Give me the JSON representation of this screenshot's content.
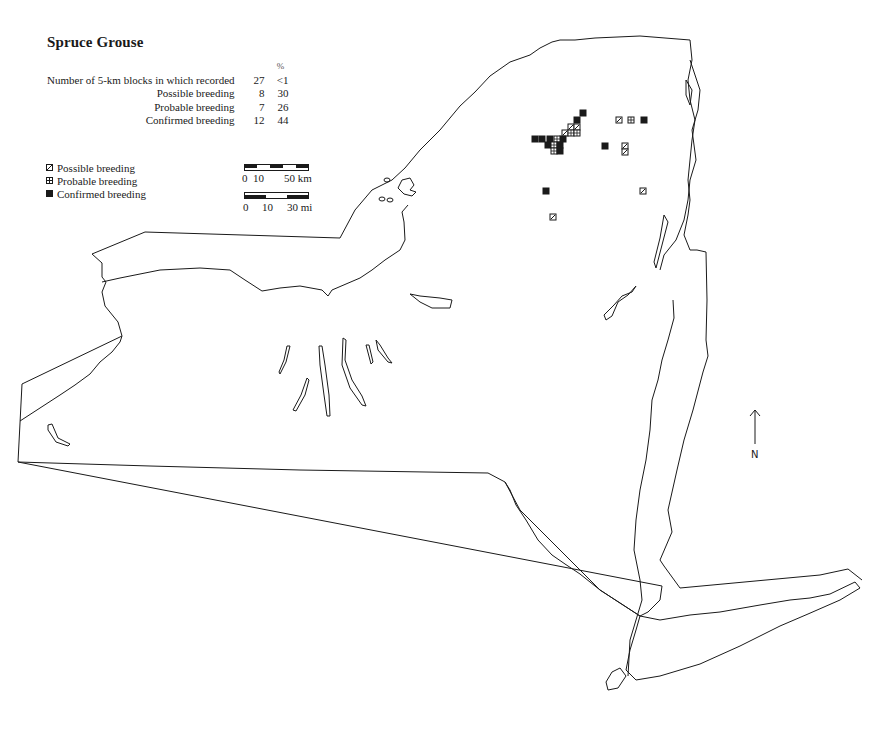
{
  "title": "Spruce Grouse",
  "stats": {
    "percent_header": "%",
    "rows": [
      {
        "label": "Number of 5-km blocks in which recorded",
        "count": "27",
        "percent": "<1"
      },
      {
        "label": "Possible breeding",
        "count": "8",
        "percent": "30"
      },
      {
        "label": "Probable breeding",
        "count": "7",
        "percent": "26"
      },
      {
        "label": "Confirmed breeding",
        "count": "12",
        "percent": "44"
      }
    ]
  },
  "legend": {
    "items": [
      {
        "symbol": "possible-square-icon",
        "label": "Possible breeding"
      },
      {
        "symbol": "probable-square-icon",
        "label": "Probable breeding"
      },
      {
        "symbol": "confirmed-square-icon",
        "label": "Confirmed breeding"
      }
    ]
  },
  "scale": {
    "km": {
      "start": "0",
      "mid": "10",
      "end": "50 km"
    },
    "mi": {
      "start": "0",
      "mid": "10",
      "end": "30 mi"
    }
  },
  "north_arrow": {
    "label": "N"
  },
  "colors": {
    "ink": "#1a1a1a",
    "background": "#ffffff"
  },
  "records": [
    {
      "type": "confirmed",
      "x": 580,
      "y": 110
    },
    {
      "type": "confirmed",
      "x": 574,
      "y": 117
    },
    {
      "type": "possible",
      "x": 568,
      "y": 124
    },
    {
      "type": "possible",
      "x": 574,
      "y": 124
    },
    {
      "type": "possible",
      "x": 562,
      "y": 130
    },
    {
      "type": "probable",
      "x": 568,
      "y": 130
    },
    {
      "type": "probable",
      "x": 574,
      "y": 130
    },
    {
      "type": "confirmed",
      "x": 560,
      "y": 136
    },
    {
      "type": "probable",
      "x": 554,
      "y": 136
    },
    {
      "type": "confirmed",
      "x": 532,
      "y": 136
    },
    {
      "type": "confirmed",
      "x": 539,
      "y": 136
    },
    {
      "type": "confirmed",
      "x": 547,
      "y": 136
    },
    {
      "type": "confirmed",
      "x": 545,
      "y": 142
    },
    {
      "type": "probable",
      "x": 551,
      "y": 142
    },
    {
      "type": "confirmed",
      "x": 557,
      "y": 142
    },
    {
      "type": "probable",
      "x": 551,
      "y": 148
    },
    {
      "type": "confirmed",
      "x": 557,
      "y": 148
    },
    {
      "type": "possible",
      "x": 616,
      "y": 117
    },
    {
      "type": "probable",
      "x": 628,
      "y": 117
    },
    {
      "type": "confirmed",
      "x": 641,
      "y": 117
    },
    {
      "type": "confirmed",
      "x": 602,
      "y": 143
    },
    {
      "type": "possible",
      "x": 622,
      "y": 143
    },
    {
      "type": "possible",
      "x": 622,
      "y": 149
    },
    {
      "type": "confirmed",
      "x": 543,
      "y": 188
    },
    {
      "type": "possible",
      "x": 640,
      "y": 188
    },
    {
      "type": "possible",
      "x": 550,
      "y": 214
    }
  ]
}
